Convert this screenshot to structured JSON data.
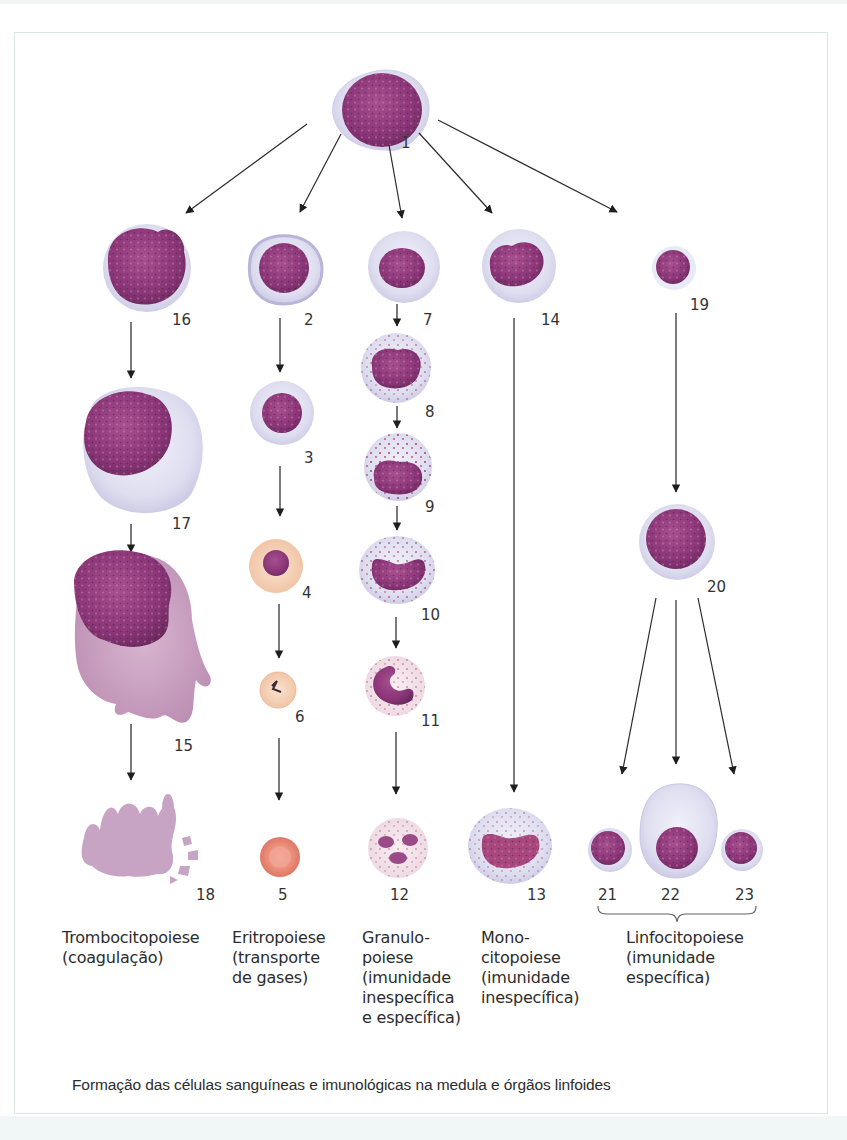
{
  "figure": {
    "caption": "Formação das células sanguíneas e imunológicas na medula e órgãos linfoides",
    "colors": {
      "nucleus": "#8e3a7c",
      "cytoplasm_blue": "#dcdcf0",
      "erythro_orange": "#f3c3a8",
      "erythrocyte": "#ec8f7c",
      "granules": "#b0456e",
      "arrow": "#222222",
      "frame": "#d9e6e6"
    },
    "cells": [
      {
        "id": "1",
        "label": "1"
      },
      {
        "id": "2",
        "label": "2"
      },
      {
        "id": "3",
        "label": "3"
      },
      {
        "id": "4",
        "label": "4"
      },
      {
        "id": "5",
        "label": "5"
      },
      {
        "id": "6",
        "label": "6"
      },
      {
        "id": "7",
        "label": "7"
      },
      {
        "id": "8",
        "label": "8"
      },
      {
        "id": "9",
        "label": "9"
      },
      {
        "id": "10",
        "label": "10"
      },
      {
        "id": "11",
        "label": "11"
      },
      {
        "id": "12",
        "label": "12"
      },
      {
        "id": "13",
        "label": "13"
      },
      {
        "id": "14",
        "label": "14"
      },
      {
        "id": "15",
        "label": "15"
      },
      {
        "id": "16",
        "label": "16"
      },
      {
        "id": "17",
        "label": "17"
      },
      {
        "id": "18",
        "label": "18"
      },
      {
        "id": "19",
        "label": "19"
      },
      {
        "id": "20",
        "label": "20"
      },
      {
        "id": "21",
        "label": "21"
      },
      {
        "id": "22",
        "label": "22"
      },
      {
        "id": "23",
        "label": "23"
      }
    ],
    "lineages": [
      {
        "name": "trombocitopoiese",
        "text": "Trombocitopoiese\n(coagulação)"
      },
      {
        "name": "eritropoiese",
        "text": "Eritropoiese\n(transporte\nde gases)"
      },
      {
        "name": "granulopoiese",
        "text": "Granulo-\npoiese\n(imunidade\ninespecífica\ne específica)"
      },
      {
        "name": "monocitopoiese",
        "text": "Mono-\ncitopoiese\n(imunidade\ninespecífica)"
      },
      {
        "name": "linfocitopoiese",
        "text": "Linfocitopoiese\n(imunidade\nespecífica)"
      }
    ]
  }
}
